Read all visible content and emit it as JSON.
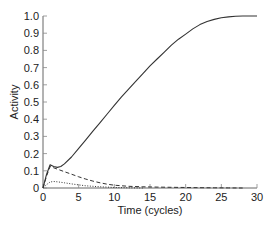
{
  "chart_data": {
    "type": "line",
    "title": "",
    "xlabel": "Time (cycles)",
    "ylabel": "Activity",
    "xlim": [
      0,
      30
    ],
    "ylim": [
      0,
      1.0
    ],
    "xticks": [
      0,
      5,
      10,
      15,
      20,
      25,
      30
    ],
    "yticks": [
      0,
      0.1,
      0.2,
      0.3,
      0.4,
      0.5,
      0.6,
      0.7,
      0.8,
      0.9,
      1.0
    ],
    "ytick_labels": [
      "0",
      "0.1",
      "0.2",
      "0.3",
      "0.4",
      "0.5",
      "0.6",
      "0.7",
      "0.8",
      "0.9",
      "1.0"
    ],
    "xtick_labels": [
      "0",
      "5",
      "10",
      "15",
      "20",
      "25",
      "30"
    ],
    "grid": false,
    "legend": null,
    "series": [
      {
        "name": "solid",
        "style": "solid",
        "x": [
          0,
          0.5,
          1,
          1.5,
          2,
          2.5,
          3,
          4,
          5,
          6,
          7,
          8,
          9,
          10,
          11,
          12,
          13,
          14,
          15,
          16,
          17,
          18,
          19,
          20,
          21,
          22,
          23,
          24,
          25,
          26,
          27,
          28,
          29,
          30
        ],
        "y": [
          0,
          0.08,
          0.135,
          0.125,
          0.12,
          0.125,
          0.14,
          0.18,
          0.23,
          0.28,
          0.33,
          0.38,
          0.43,
          0.48,
          0.53,
          0.575,
          0.62,
          0.665,
          0.71,
          0.75,
          0.79,
          0.83,
          0.865,
          0.895,
          0.925,
          0.95,
          0.968,
          0.98,
          0.99,
          0.995,
          0.998,
          1.0,
          1.0,
          1.0
        ]
      },
      {
        "name": "dashed",
        "style": "dashed",
        "x": [
          0,
          0.5,
          1,
          2,
          3,
          4,
          5,
          6,
          7,
          8,
          9,
          10,
          12,
          14,
          16,
          18,
          20,
          22,
          24,
          26,
          28
        ],
        "y": [
          0,
          0.07,
          0.125,
          0.11,
          0.095,
          0.08,
          0.065,
          0.052,
          0.04,
          0.03,
          0.022,
          0.016,
          0.01,
          0.007,
          0.005,
          0.004,
          0.003,
          0.002,
          0.001,
          0.0005,
          0
        ]
      },
      {
        "name": "dotted",
        "style": "dotted",
        "x": [
          0,
          0.5,
          1,
          1.5,
          2,
          3,
          4,
          5,
          6,
          7,
          8,
          9,
          10,
          12,
          14
        ],
        "y": [
          0,
          0.02,
          0.035,
          0.038,
          0.036,
          0.03,
          0.024,
          0.018,
          0.013,
          0.01,
          0.007,
          0.005,
          0.003,
          0.001,
          0
        ]
      }
    ]
  }
}
